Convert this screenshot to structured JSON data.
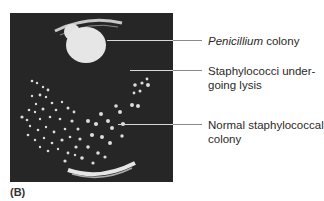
{
  "figure": {
    "panel_label": "(B)",
    "photo_description": "Petri dish with Penicillium colony and staphylococci",
    "labels": [
      {
        "id": "penicillium",
        "italic_part": "Penicillium",
        "rest": " colony"
      },
      {
        "id": "lysis",
        "line1": "Staphylococci under-",
        "line2": "going lysis"
      },
      {
        "id": "normal",
        "line1": "Normal staphylococcal",
        "line2": "colony"
      }
    ]
  }
}
